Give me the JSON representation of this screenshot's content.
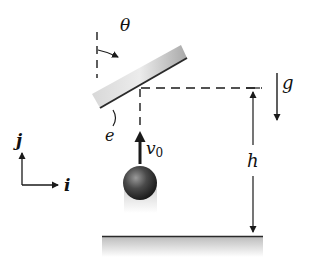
{
  "diagram": {
    "labels": {
      "theta": "θ",
      "g": "g",
      "e": "e",
      "v0_main": "v",
      "v0_sub": "0",
      "h": "h",
      "j": "j",
      "i": "i"
    },
    "colors": {
      "ink": "#1a1a1a",
      "ball": "#333333",
      "plate_light": "#f4f4f4",
      "plate_dark": "#b0b0b0",
      "ground_shade": "#c8c8c8"
    }
  }
}
